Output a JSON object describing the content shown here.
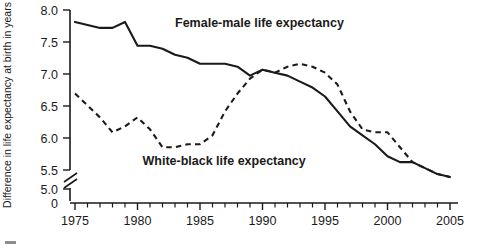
{
  "chart_data": {
    "type": "line",
    "title": "",
    "xlabel": "",
    "ylabel": "Difference in life expectancy at birth in years",
    "xlim": [
      1975,
      2005
    ],
    "ylim": [
      5.0,
      8.0
    ],
    "y_axis_break": true,
    "y_break_from": 0,
    "y_break_to": 5.0,
    "grid": false,
    "legend_position": "inline-annotations",
    "ytick_labels": [
      "0",
      "5.0",
      "5.5",
      "6.0",
      "6.5",
      "7.0",
      "7.5",
      "8.0"
    ],
    "xtick_labels": [
      "1975",
      "1980",
      "1985",
      "1990",
      "1995",
      "2000",
      "2005"
    ],
    "x": [
      1975,
      1976,
      1977,
      1978,
      1979,
      1980,
      1981,
      1982,
      1983,
      1984,
      1985,
      1986,
      1987,
      1988,
      1989,
      1990,
      1991,
      1992,
      1993,
      1994,
      1995,
      1996,
      1997,
      1998,
      1999,
      2000,
      2001,
      2002,
      2003,
      2004,
      2005
    ],
    "series": [
      {
        "name": "Female-male life expectancy",
        "style": "solid",
        "color": "#1a1a1a",
        "values": [
          7.8,
          7.75,
          7.7,
          7.7,
          7.8,
          7.4,
          7.4,
          7.35,
          7.25,
          7.2,
          7.1,
          7.1,
          7.1,
          7.05,
          6.9,
          7.0,
          6.95,
          6.9,
          6.8,
          6.7,
          6.55,
          6.3,
          6.05,
          5.9,
          5.75,
          5.55,
          5.45,
          5.45,
          5.35,
          5.25,
          5.2
        ]
      },
      {
        "name": "White-black life expectancy",
        "style": "dashed",
        "color": "#1a1a1a",
        "values": [
          6.6,
          6.4,
          6.2,
          5.95,
          6.05,
          6.2,
          6.0,
          5.7,
          5.7,
          5.75,
          5.75,
          5.9,
          6.3,
          6.6,
          6.85,
          7.0,
          6.95,
          7.05,
          7.1,
          7.05,
          6.95,
          6.75,
          6.3,
          6.0,
          5.95,
          5.95,
          5.7,
          5.45,
          5.35,
          5.25,
          5.2
        ]
      }
    ],
    "annotations": [
      {
        "id": "label-female-male",
        "text": "Female-male life expectancy",
        "x": 1983.0,
        "y": 7.72
      },
      {
        "id": "label-white-black",
        "text": "White-black life expectancy",
        "x": 1980.4,
        "y": 5.41
      }
    ]
  }
}
